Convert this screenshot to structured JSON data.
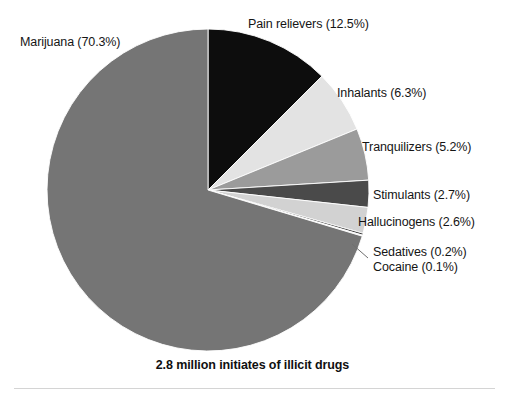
{
  "caption": "2.8 million initiates of illicit drugs",
  "chart_data": {
    "type": "pie",
    "title": "2.8 million initiates of illicit drugs",
    "xlabel": "",
    "ylabel": "",
    "units": "percent",
    "total_label": "2.8 million initiates of illicit drugs",
    "start_angle_deg": 0,
    "direction": "clockwise",
    "legend_position": "outside-labels",
    "grid": false,
    "categories": [
      "Pain relievers",
      "Inhalants",
      "Tranquilizers",
      "Stimulants",
      "Hallucinogens",
      "Sedatives",
      "Cocaine",
      "Marijuana"
    ],
    "values": [
      12.5,
      6.3,
      5.2,
      2.7,
      2.6,
      0.2,
      0.1,
      70.3
    ],
    "colors": [
      "#0d0d0d",
      "#e3e3e3",
      "#9b9b9b",
      "#4a4a4a",
      "#d2d2d2",
      "#3a3a3a",
      "#e8e8e8",
      "#757575"
    ],
    "slices": [
      {
        "name": "Pain relievers",
        "value": 12.5,
        "label": "Pain relievers (12.5%)",
        "color": "#0d0d0d"
      },
      {
        "name": "Inhalants",
        "value": 6.3,
        "label": "Inhalants (6.3%)",
        "color": "#e3e3e3"
      },
      {
        "name": "Tranquilizers",
        "value": 5.2,
        "label": "Tranquilizers (5.2%)",
        "color": "#9b9b9b"
      },
      {
        "name": "Stimulants",
        "value": 2.7,
        "label": "Stimulants (2.7%)",
        "color": "#4a4a4a"
      },
      {
        "name": "Hallucinogens",
        "value": 2.6,
        "label": "Hallucinogens (2.6%)",
        "color": "#d2d2d2"
      },
      {
        "name": "Sedatives",
        "value": 0.2,
        "label": "Sedatives (0.2%)",
        "color": "#3a3a3a"
      },
      {
        "name": "Cocaine",
        "value": 0.1,
        "label": "Cocaine (0.1%)",
        "color": "#e8e8e8"
      },
      {
        "name": "Marijuana",
        "value": 70.3,
        "label": "Marijuana (70.3%)",
        "color": "#757575"
      }
    ]
  },
  "labels": {
    "marijuana": "Marijuana (70.3%)",
    "pain_relievers": "Pain relievers (12.5%)",
    "inhalants": "Inhalants (6.3%)",
    "tranquilizers": "Tranquilizers (5.2%)",
    "stimulants": "Stimulants (2.7%)",
    "hallucinogens": "Hallucinogens (2.6%)",
    "sedatives": "Sedatives (0.2%)",
    "cocaine": "Cocaine (0.1%)"
  }
}
